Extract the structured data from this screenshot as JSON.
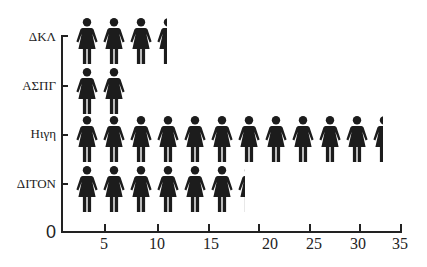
{
  "chart_data": {
    "type": "bar",
    "orientation": "horizontal",
    "style": "pictograph",
    "icon": "woman-figure-icon",
    "title": "",
    "xlabel": "",
    "ylabel": "",
    "categories": [
      "ΔΚΛ",
      "ΑΣΠΓ",
      "Ηιγη",
      "ΔΙΤΟΝ"
    ],
    "values": [
      11.5,
      7,
      32.5,
      19
    ],
    "icon_counts": [
      3.45,
      2,
      11.45,
      6.3
    ],
    "origin_label": "0",
    "xticks": [
      5,
      10,
      15,
      20,
      25,
      30,
      35
    ],
    "xlim": [
      0,
      35
    ],
    "grid": false,
    "legend": null,
    "colors": {
      "icon": "#1c1c1c",
      "axis": "#222222",
      "background": "#ffffff"
    }
  }
}
